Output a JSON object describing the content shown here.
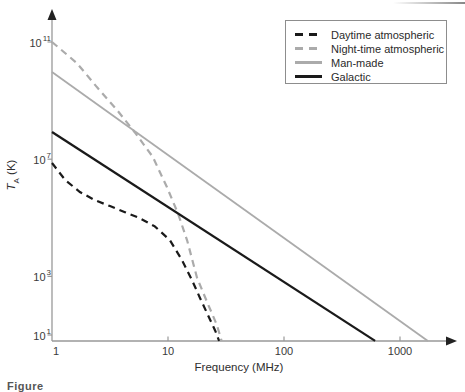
{
  "figure": {
    "x_label": "Frequency (MHz)",
    "y_label_main": "T",
    "y_label_sub": "A",
    "y_label_unit": " (K)",
    "x_tick_labels": [
      "1",
      "10",
      "100",
      "1000"
    ],
    "y_tick_labels": [
      {
        "base": "10",
        "exp": "11"
      },
      {
        "base": "10",
        "exp": "7"
      },
      {
        "base": "10",
        "exp": "3"
      },
      {
        "base": "10",
        "exp": "1"
      }
    ],
    "caption_fragment": "Figure"
  },
  "legend": {
    "position": "top-right",
    "border_color": "#8d8d8d"
  },
  "colors": {
    "black_curve": "#1a1a1a",
    "gray_curve": "#ababab",
    "axis": "#999999",
    "arrow": "#222222"
  },
  "chart_data": {
    "type": "line",
    "title": "",
    "xlabel": "Frequency (MHz)",
    "ylabel": "T_A (K)",
    "x_scale": "log",
    "y_scale": "log",
    "xlim": [
      1,
      3000
    ],
    "ylim": [
      6,
      1000000000000.0
    ],
    "grid": false,
    "legend_position": "top-right",
    "x_ticks": [
      1,
      10,
      100,
      1000
    ],
    "y_tick_values": [
      100000000000.0,
      10000000.0,
      1000.0,
      10.0
    ],
    "series": [
      {
        "name": "Daytime atmospheric",
        "color": "#1a1a1a",
        "style": "dashed",
        "width": 2.2,
        "points": [
          [
            1,
            7400000.0
          ],
          [
            1.3,
            1950000.0
          ],
          [
            1.74,
            760000.0
          ],
          [
            2.35,
            400000.0
          ],
          [
            3.16,
            250000.0
          ],
          [
            4.26,
            155000.0
          ],
          [
            5.74,
            96000.0
          ],
          [
            7.7,
            51000.0
          ],
          [
            10.4,
            17000.0
          ],
          [
            13.2,
            3600
          ],
          [
            16.1,
            750
          ],
          [
            18.9,
            180
          ],
          [
            22.1,
            48
          ],
          [
            25.5,
            14
          ],
          [
            27.6,
            6.3
          ]
        ]
      },
      {
        "name": "Night-time atmospheric",
        "color": "#ababab",
        "style": "dashed",
        "width": 2.2,
        "points": [
          [
            1,
            100000000000.0
          ],
          [
            1.64,
            19000000000.0
          ],
          [
            2.44,
            2900000000.0
          ],
          [
            3.63,
            480000000.0
          ],
          [
            5.2,
            80000000.0
          ],
          [
            7.4,
            12000000.0
          ],
          [
            9.8,
            1100000.0
          ],
          [
            12.2,
            140000.0
          ],
          [
            14.6,
            17000.0
          ],
          [
            17.8,
            900
          ],
          [
            21.7,
            135
          ],
          [
            26.4,
            22
          ],
          [
            29,
            6.3
          ]
        ]
      },
      {
        "name": "Man-made",
        "color": "#ababab",
        "style": "solid",
        "width": 1.8,
        "points": [
          [
            1,
            9500000000.0
          ],
          [
            1740,
            6.3
          ]
        ]
      },
      {
        "name": "Galactic",
        "color": "#1a1a1a",
        "style": "solid",
        "width": 2.3,
        "points": [
          [
            1,
            85000000.0
          ],
          [
            610,
            6.3
          ]
        ]
      }
    ]
  }
}
